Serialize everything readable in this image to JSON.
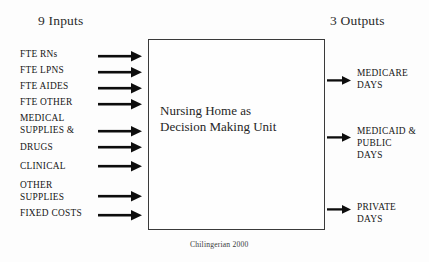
{
  "figure": {
    "caption": "Chilingerian 2000",
    "inputs_heading": "9 Inputs",
    "outputs_heading": "3 Outputs"
  },
  "dmu": {
    "line1": "Nursing Home as",
    "line2": "Decision Making Unit"
  },
  "inputs": [
    {
      "lines": [
        "FTE RNs"
      ],
      "label_top": 48,
      "arrow_top": 50
    },
    {
      "lines": [
        "FTE LPNS"
      ],
      "label_top": 64,
      "arrow_top": 66
    },
    {
      "lines": [
        "FTE AIDES"
      ],
      "label_top": 80,
      "arrow_top": 82
    },
    {
      "lines": [
        "FTE OTHER"
      ],
      "label_top": 96,
      "arrow_top": 98
    },
    {
      "lines": [
        "MEDICAL",
        "SUPPLIES &"
      ],
      "label_top": 112,
      "arrow_top": 125
    },
    {
      "lines": [
        "DRUGS"
      ],
      "label_top": 141,
      "arrow_top": 141
    },
    {
      "lines": [
        "CLINICAL"
      ],
      "label_top": 160,
      "arrow_top": 160
    },
    {
      "lines": [
        "OTHER",
        "SUPPLIES"
      ],
      "label_top": 179,
      "arrow_top": 190
    },
    {
      "lines": [
        "FIXED COSTS"
      ],
      "label_top": 207,
      "arrow_top": 209
    }
  ],
  "outputs": [
    {
      "lines": [
        "MEDICARE",
        "DAYS"
      ],
      "label_top": 67,
      "arrow_top": 75
    },
    {
      "lines": [
        "MEDICAID &",
        "PUBLIC",
        "DAYS"
      ],
      "label_top": 125,
      "arrow_top": 132
    },
    {
      "lines": [
        "PRIVATE",
        "DAYS"
      ],
      "label_top": 201,
      "arrow_top": 204
    }
  ],
  "colors": {
    "background": "#fdfdfd",
    "box_border": "#3a3a3a",
    "arrow": "#0d0d0d",
    "text": "#151515"
  }
}
